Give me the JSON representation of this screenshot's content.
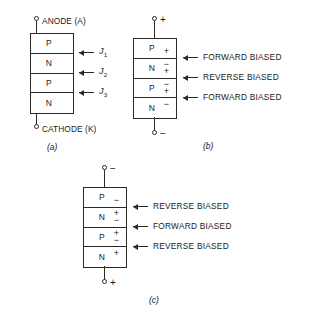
{
  "figure": {
    "colors": {
      "ink": "#2a2a2a",
      "background": "#ffffff"
    }
  },
  "fig_a": {
    "caption": "(a)",
    "top_terminal_label": "ANODE (A)",
    "bottom_terminal_label": "CATHODE (K)",
    "layers": [
      {
        "type": "P"
      },
      {
        "type": "N"
      },
      {
        "type": "P"
      },
      {
        "type": "N"
      }
    ],
    "junctions": [
      {
        "symbol": "J",
        "subscript": "1"
      },
      {
        "symbol": "J",
        "subscript": "2"
      },
      {
        "symbol": "J",
        "subscript": "3"
      }
    ]
  },
  "fig_b": {
    "caption": "(b)",
    "top_polarity": "+",
    "bottom_polarity": "−",
    "layers": [
      {
        "type": "P",
        "bottom_sign": "+"
      },
      {
        "type": "N",
        "top_sign": "−",
        "bottom_sign": "+"
      },
      {
        "type": "P",
        "top_sign": "−",
        "bottom_sign": "+"
      },
      {
        "type": "N",
        "top_sign": "−"
      }
    ],
    "junction_bias": [
      "FORWARD BIASED",
      "REVERSE BIASED",
      "FORWARD BIASED"
    ]
  },
  "fig_c": {
    "caption": "(c)",
    "top_polarity": "−",
    "bottom_polarity": "+",
    "layers": [
      {
        "type": "P",
        "bottom_sign": "−"
      },
      {
        "type": "N",
        "top_sign": "+",
        "bottom_sign": "−"
      },
      {
        "type": "P",
        "top_sign": "+",
        "bottom_sign": "−"
      },
      {
        "type": "N",
        "top_sign": "+"
      }
    ],
    "junction_bias": [
      "REVERSE BIASED",
      "FORWARD BIASED",
      "REVERSE BIASED"
    ]
  }
}
